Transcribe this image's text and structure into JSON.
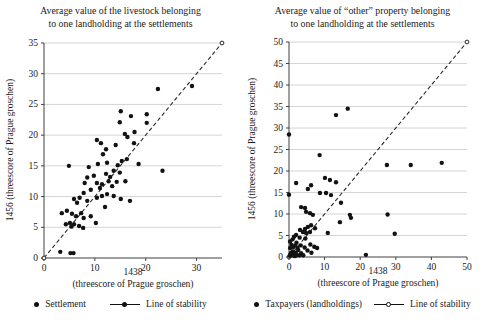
{
  "page": {
    "background": "#ffffff"
  },
  "colors": {
    "point": "#121212",
    "gridline": "#d4d4d4",
    "axis": "#404040",
    "stability_line": "#262626",
    "text": "#1a1a1a"
  },
  "chart_data": [
    {
      "type": "scatter",
      "title_lines": [
        "Average value of the livestock belonging",
        "to one landholding at the settlements"
      ],
      "xlabel_lines": [
        "1438",
        "(threescore of Prague groschen)"
      ],
      "ylabel": "1456 (threescore of Prague groschen)",
      "axes": {
        "x_min": 0,
        "x_max": 35,
        "x_ticks": [
          0,
          10,
          20,
          30
        ],
        "y_min": 0,
        "y_max": 35,
        "y_ticks": [
          0,
          5,
          10,
          15,
          20,
          25,
          30,
          35
        ],
        "grid": "horizontal"
      },
      "legend": [
        {
          "marker": "point",
          "label": "Settlement"
        },
        {
          "marker": "line",
          "label": "Line of stability"
        }
      ],
      "stability_line": {
        "x1": 0,
        "y1": 0,
        "x2": 35,
        "y2": 35,
        "style": "dashed",
        "end_markers": true
      },
      "points": [
        [
          3.2,
          1.0
        ],
        [
          5.2,
          0.8
        ],
        [
          5.8,
          0.8
        ],
        [
          5.4,
          5.1
        ],
        [
          7.7,
          4.9
        ],
        [
          4.3,
          5.5
        ],
        [
          5.1,
          5.7
        ],
        [
          5.9,
          5.5
        ],
        [
          6.9,
          5.2
        ],
        [
          10.2,
          5.7
        ],
        [
          6.3,
          6.8
        ],
        [
          7.8,
          6.5
        ],
        [
          9.2,
          6.8
        ],
        [
          3.5,
          7.3
        ],
        [
          4.5,
          7.7
        ],
        [
          5.5,
          7.2
        ],
        [
          7.3,
          7.3
        ],
        [
          12.0,
          8.3
        ],
        [
          6.5,
          9.0
        ],
        [
          8.5,
          9.3
        ],
        [
          5.9,
          9.6
        ],
        [
          7.0,
          9.8
        ],
        [
          10.4,
          9.8
        ],
        [
          15.1,
          9.6
        ],
        [
          16.9,
          9.3
        ],
        [
          13.7,
          10.1
        ],
        [
          12.4,
          10.4
        ],
        [
          11.4,
          10.1
        ],
        [
          7.8,
          10.6
        ],
        [
          9.2,
          11.1
        ],
        [
          11.0,
          11.4
        ],
        [
          13.4,
          11.7
        ],
        [
          8.0,
          12.2
        ],
        [
          10.4,
          12.2
        ],
        [
          11.4,
          12.0
        ],
        [
          12.7,
          12.5
        ],
        [
          14.3,
          12.4
        ],
        [
          16.0,
          12.5
        ],
        [
          8.5,
          13.1
        ],
        [
          9.8,
          13.4
        ],
        [
          13.0,
          13.2
        ],
        [
          12.2,
          13.7
        ],
        [
          14.9,
          13.9
        ],
        [
          13.7,
          14.2
        ],
        [
          23.3,
          14.2
        ],
        [
          8.8,
          14.8
        ],
        [
          4.9,
          15.0
        ],
        [
          14.5,
          15.1
        ],
        [
          10.6,
          15.3
        ],
        [
          18.6,
          15.3
        ],
        [
          12.4,
          15.5
        ],
        [
          15.3,
          15.8
        ],
        [
          16.3,
          16.1
        ],
        [
          11.6,
          16.9
        ],
        [
          12.2,
          17.7
        ],
        [
          14.1,
          18.4
        ],
        [
          11.2,
          18.7
        ],
        [
          17.7,
          18.7
        ],
        [
          10.4,
          19.2
        ],
        [
          16.4,
          19.7
        ],
        [
          15.9,
          20.2
        ],
        [
          17.8,
          20.5
        ],
        [
          20.2,
          22.0
        ],
        [
          14.9,
          22.1
        ],
        [
          17.1,
          23.1
        ],
        [
          20.2,
          23.4
        ],
        [
          15.1,
          23.9
        ],
        [
          22.4,
          27.5
        ],
        [
          29.1,
          28.0
        ]
      ]
    },
    {
      "type": "scatter",
      "title_lines": [
        "Average value of “other” property belonging",
        "to one landholding at the settlements"
      ],
      "xlabel_lines": [
        "1438",
        "(threescore of Prague groschen)"
      ],
      "ylabel": "1456 (threescore of Prague groschen)",
      "axes": {
        "x_min": 0,
        "x_max": 50,
        "x_ticks": [
          0,
          10,
          20,
          30,
          40,
          50
        ],
        "y_min": 0,
        "y_max": 50,
        "y_ticks": [
          0,
          5,
          10,
          15,
          20,
          25,
          30,
          35,
          40,
          45,
          50
        ],
        "grid": "horizontal"
      },
      "legend": [
        {
          "marker": "point",
          "label": "Taxpayers (landholdings)"
        },
        {
          "marker": "line",
          "label": "Line of stability"
        }
      ],
      "stability_line": {
        "x1": 0,
        "y1": 0,
        "x2": 50,
        "y2": 50,
        "style": "dashed",
        "end_markers": true
      },
      "points": [
        [
          0.2,
          0.3
        ],
        [
          0.5,
          0.9
        ],
        [
          0.8,
          0.4
        ],
        [
          1.0,
          1.3
        ],
        [
          1.3,
          0.6
        ],
        [
          1.6,
          0.2
        ],
        [
          1.9,
          1.0
        ],
        [
          2.2,
          0.4
        ],
        [
          2.6,
          1.6
        ],
        [
          3.0,
          0.4
        ],
        [
          3.4,
          0.9
        ],
        [
          4.0,
          0.4
        ],
        [
          0.3,
          2.1
        ],
        [
          0.7,
          2.8
        ],
        [
          1.2,
          2.3
        ],
        [
          1.7,
          2.7
        ],
        [
          2.4,
          2.1
        ],
        [
          0.3,
          3.6
        ],
        [
          1.0,
          4.1
        ],
        [
          2.1,
          3.3
        ],
        [
          3.3,
          2.7
        ],
        [
          4.4,
          2.2
        ],
        [
          5.2,
          1.5
        ],
        [
          6.3,
          1.0
        ],
        [
          6.0,
          2.9
        ],
        [
          7.1,
          2.4
        ],
        [
          7.9,
          2.1
        ],
        [
          1.4,
          4.7
        ],
        [
          3.0,
          4.5
        ],
        [
          4.6,
          4.3
        ],
        [
          2.0,
          5.1
        ],
        [
          3.1,
          6.3
        ],
        [
          3.9,
          5.8
        ],
        [
          4.5,
          6.5
        ],
        [
          4.8,
          5.6
        ],
        [
          5.9,
          5.8
        ],
        [
          5.3,
          7.0
        ],
        [
          6.2,
          7.4
        ],
        [
          7.3,
          6.7
        ],
        [
          10.9,
          5.6
        ],
        [
          21.6,
          0.5
        ],
        [
          3.4,
          11.6
        ],
        [
          4.5,
          11.4
        ],
        [
          4.8,
          10.5
        ],
        [
          5.9,
          10.2
        ],
        [
          6.7,
          9.8
        ],
        [
          0,
          14.5
        ],
        [
          2.0,
          17.2
        ],
        [
          5.3,
          15.8
        ],
        [
          6.2,
          16.7
        ],
        [
          8.7,
          14.9
        ],
        [
          10.4,
          14.9
        ],
        [
          11.8,
          14.4
        ],
        [
          10.1,
          18.4
        ],
        [
          11.5,
          17.9
        ],
        [
          13.2,
          17.4
        ],
        [
          14.6,
          12.6
        ],
        [
          14.3,
          8.1
        ],
        [
          17.1,
          9.8
        ],
        [
          17.4,
          9.1
        ],
        [
          8.6,
          23.7
        ],
        [
          13.2,
          33.0
        ],
        [
          16.5,
          34.5
        ],
        [
          0,
          28.5
        ],
        [
          27.5,
          21.4
        ],
        [
          34.2,
          21.4
        ],
        [
          42.9,
          21.9
        ],
        [
          27.7,
          9.9
        ],
        [
          29.7,
          5.4
        ]
      ]
    }
  ]
}
